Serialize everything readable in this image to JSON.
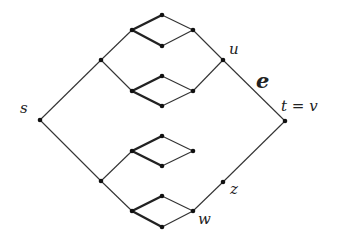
{
  "diagram": {
    "type": "graph",
    "colors": {
      "edge": "#333333",
      "thick_edge": "#222222",
      "node": "#111111",
      "background": "#ffffff"
    },
    "nodes": [
      {
        "id": "s",
        "x": 40,
        "y": 120
      },
      {
        "id": "a",
        "x": 101,
        "y": 60
      },
      {
        "id": "d1l",
        "x": 132,
        "y": 30
      },
      {
        "id": "d1t",
        "x": 162,
        "y": 15
      },
      {
        "id": "d1b",
        "x": 162,
        "y": 46
      },
      {
        "id": "d1r",
        "x": 193,
        "y": 30
      },
      {
        "id": "u",
        "x": 223,
        "y": 60
      },
      {
        "id": "d2l",
        "x": 132,
        "y": 91
      },
      {
        "id": "d2t",
        "x": 162,
        "y": 76
      },
      {
        "id": "d2b",
        "x": 162,
        "y": 106
      },
      {
        "id": "d2r",
        "x": 193,
        "y": 91
      },
      {
        "id": "t",
        "x": 285,
        "y": 121
      },
      {
        "id": "b",
        "x": 101,
        "y": 181
      },
      {
        "id": "d3l",
        "x": 132,
        "y": 151
      },
      {
        "id": "d3t",
        "x": 162,
        "y": 136
      },
      {
        "id": "d3b",
        "x": 162,
        "y": 166
      },
      {
        "id": "d3r",
        "x": 193,
        "y": 151
      },
      {
        "id": "d4l",
        "x": 132,
        "y": 211
      },
      {
        "id": "d4t",
        "x": 162,
        "y": 196
      },
      {
        "id": "d4b",
        "x": 162,
        "y": 227
      },
      {
        "id": "w",
        "x": 193,
        "y": 211
      },
      {
        "id": "z",
        "x": 223,
        "y": 182
      }
    ],
    "edges": [
      {
        "from": "s",
        "to": "a",
        "thick": false
      },
      {
        "from": "a",
        "to": "d1l",
        "thick": false
      },
      {
        "from": "d1l",
        "to": "d1t",
        "thick": true
      },
      {
        "from": "d1l",
        "to": "d1b",
        "thick": true
      },
      {
        "from": "d1t",
        "to": "d1r",
        "thick": false
      },
      {
        "from": "d1b",
        "to": "d1r",
        "thick": false
      },
      {
        "from": "d1r",
        "to": "u",
        "thick": false
      },
      {
        "from": "a",
        "to": "d2l",
        "thick": false
      },
      {
        "from": "d2l",
        "to": "d2t",
        "thick": true
      },
      {
        "from": "d2l",
        "to": "d2b",
        "thick": true
      },
      {
        "from": "d2t",
        "to": "d2r",
        "thick": false
      },
      {
        "from": "d2b",
        "to": "d2r",
        "thick": false
      },
      {
        "from": "d2r",
        "to": "u",
        "thick": false
      },
      {
        "from": "u",
        "to": "t",
        "thick": false
      },
      {
        "from": "s",
        "to": "b",
        "thick": false
      },
      {
        "from": "b",
        "to": "d3l",
        "thick": false
      },
      {
        "from": "d3l",
        "to": "d3t",
        "thick": true
      },
      {
        "from": "d3l",
        "to": "d3b",
        "thick": true
      },
      {
        "from": "d3t",
        "to": "d3r",
        "thick": false
      },
      {
        "from": "d3b",
        "to": "d3r",
        "thick": false
      },
      {
        "from": "b",
        "to": "d4l",
        "thick": false
      },
      {
        "from": "d4l",
        "to": "d4t",
        "thick": true
      },
      {
        "from": "d4l",
        "to": "d4b",
        "thick": true
      },
      {
        "from": "d4t",
        "to": "w",
        "thick": false
      },
      {
        "from": "d4b",
        "to": "w",
        "thick": false
      },
      {
        "from": "w",
        "to": "z",
        "thick": false
      },
      {
        "from": "z",
        "to": "t",
        "thick": false
      }
    ],
    "labels": {
      "s": "s",
      "u": "u",
      "e": "e",
      "t": "t = v",
      "z": "z",
      "w": "w"
    }
  }
}
